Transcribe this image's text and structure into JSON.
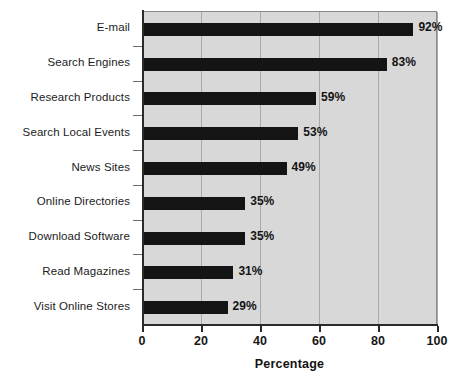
{
  "chart_data": {
    "type": "bar",
    "orientation": "horizontal",
    "title": "",
    "xlabel": "Percentage",
    "ylabel": "",
    "xlim": [
      0,
      100
    ],
    "xticks": [
      0,
      20,
      40,
      60,
      80,
      100
    ],
    "xtick_labels": [
      "0",
      "20",
      "40",
      "60",
      "80",
      "100"
    ],
    "grid": true,
    "grid_axis": "x",
    "legend": false,
    "categories": [
      "E-mail",
      "Search Engines",
      "Research Products",
      "Search Local Events",
      "News Sites",
      "Online Directories",
      "Download Software",
      "Read Magazines",
      "Visit Online Stores"
    ],
    "values": [
      92,
      83,
      59,
      53,
      49,
      35,
      35,
      31,
      29
    ],
    "value_labels": [
      "92%",
      "83%",
      "59%",
      "53%",
      "49%",
      "35%",
      "35%",
      "31%",
      "29%"
    ],
    "bar_color": "#141414",
    "plot_background": "#d8d8d8",
    "grid_color": "#a8a8a8",
    "axis_color": "#2b2b2b"
  },
  "axis_title": {
    "x": "Percentage"
  }
}
